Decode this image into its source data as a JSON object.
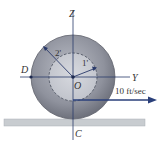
{
  "diagram": {
    "labels": {
      "z_axis": "Z",
      "y_axis": "Y",
      "center": "O",
      "left_point": "D",
      "contact_point": "C",
      "outer_radius": "2'",
      "inner_radius": "1'",
      "velocity": "10 ft/sec"
    },
    "colors": {
      "outer_disk": "#8c8f9a",
      "inner_disk": "#c9cbd2",
      "ground": "#c8ccd0",
      "axis": "#2a3a6a",
      "arrow": "#2a3f7a"
    }
  }
}
